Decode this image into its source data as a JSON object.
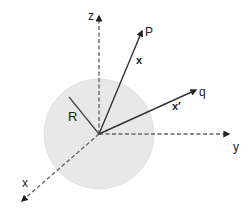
{
  "diagram": {
    "type": "coordinate-system-sphere",
    "background": "#ffffff",
    "origin": {
      "x": 99,
      "y": 134
    },
    "sphere": {
      "cx": 99,
      "cy": 134,
      "r": 55,
      "fill": "#e8e8e8",
      "stroke": "#dddddd"
    },
    "axes": [
      {
        "name": "z",
        "label": "z",
        "x2": 99,
        "y2": 16,
        "label_x": 88,
        "label_y": 20
      },
      {
        "name": "y",
        "label": "y",
        "x2": 229,
        "y2": 134,
        "label_x": 233,
        "label_y": 151
      },
      {
        "name": "x",
        "label": "x",
        "x2": 22,
        "y2": 201,
        "label_x": 22,
        "label_y": 187
      }
    ],
    "vectors": [
      {
        "name": "vector-x",
        "point_label": "P",
        "vector_label": "x",
        "x2": 142,
        "y2": 31,
        "point_label_x": 145,
        "point_label_y": 36,
        "vector_label_x": 136,
        "vector_label_y": 64
      },
      {
        "name": "vector-x-prime",
        "point_label": "q",
        "vector_label": "x′",
        "x2": 196,
        "y2": 90,
        "point_label_x": 199,
        "point_label_y": 96,
        "vector_label_x": 172,
        "vector_label_y": 110
      }
    ],
    "radius": {
      "label": "R",
      "x2": 69,
      "y2": 97,
      "label_x": 68,
      "label_y": 121
    },
    "colors": {
      "axis": "#666666",
      "vector": "#333333",
      "radius": "#444444",
      "text": "#222222"
    }
  }
}
